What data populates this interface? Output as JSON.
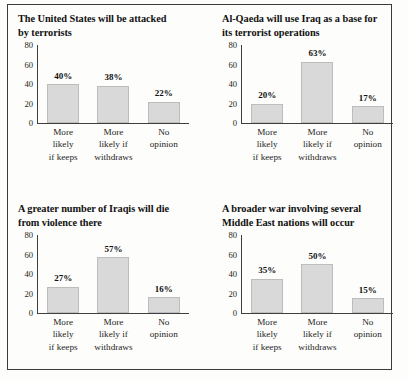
{
  "page": {
    "background_color": "#fdfdfb",
    "rule_color": "#3b3b3b",
    "bar_fill_color": "#d9d9d9",
    "bar_border_color": "#bdbdbd"
  },
  "charts": [
    {
      "id": "chart-terrorist-attack",
      "title_line1": "The United States will be attacked",
      "title_line2": "by terrorists",
      "y_ticks": [
        "80",
        "60",
        "40",
        "20",
        "0"
      ],
      "categories": [
        {
          "line1": "More",
          "line2": "likely",
          "line3": "if keeps"
        },
        {
          "line1": "More",
          "line2": "likely if",
          "line3": "withdraws"
        },
        {
          "line1": "No",
          "line2": "opinion",
          "line3": ""
        }
      ],
      "values": [
        40,
        38,
        22
      ],
      "value_labels": [
        "40%",
        "38%",
        "22%"
      ]
    },
    {
      "id": "chart-alqaeda-base",
      "title_line1": "Al-Qaeda will use Iraq as a base for",
      "title_line2": "its terrorist operations",
      "y_ticks": [
        "80",
        "60",
        "40",
        "20",
        "0"
      ],
      "categories": [
        {
          "line1": "More",
          "line2": "likely",
          "line3": "if keeps"
        },
        {
          "line1": "More",
          "line2": "likely if",
          "line3": "withdraws"
        },
        {
          "line1": "No",
          "line2": "opinion",
          "line3": ""
        }
      ],
      "values": [
        20,
        63,
        17
      ],
      "value_labels": [
        "20%",
        "63%",
        "17%"
      ]
    },
    {
      "id": "chart-iraqi-deaths",
      "title_line1": "A greater number of Iraqis will die",
      "title_line2": "from violence there",
      "y_ticks": [
        "80",
        "60",
        "40",
        "20",
        "0"
      ],
      "categories": [
        {
          "line1": "More",
          "line2": "likely",
          "line3": "if keeps"
        },
        {
          "line1": "More",
          "line2": "likely if",
          "line3": "withdraws"
        },
        {
          "line1": "No",
          "line2": "opinion",
          "line3": ""
        }
      ],
      "values": [
        27,
        57,
        16
      ],
      "value_labels": [
        "27%",
        "57%",
        "16%"
      ]
    },
    {
      "id": "chart-broader-war",
      "title_line1": "A broader war involving several",
      "title_line2": "Middle East nations will occur",
      "y_ticks": [
        "80",
        "60",
        "40",
        "20",
        "0"
      ],
      "categories": [
        {
          "line1": "More",
          "line2": "likely",
          "line3": "if keeps"
        },
        {
          "line1": "More",
          "line2": "likely if",
          "line3": "withdraws"
        },
        {
          "line1": "No",
          "line2": "opinion",
          "line3": ""
        }
      ],
      "values": [
        35,
        50,
        15
      ],
      "value_labels": [
        "35%",
        "50%",
        "15%"
      ]
    }
  ],
  "chart_data": [
    {
      "type": "bar",
      "title": "The United States will be attacked by terrorists",
      "categories": [
        "More likely if keeps",
        "More likely if withdraws",
        "No opinion"
      ],
      "values": [
        40,
        38,
        22
      ],
      "data_labels": [
        "40%",
        "38%",
        "22%"
      ],
      "xlabel": "",
      "ylabel": "",
      "ylim": [
        0,
        80
      ],
      "yticks": [
        0,
        20,
        40,
        60,
        80
      ],
      "grid": false,
      "legend": "none"
    },
    {
      "type": "bar",
      "title": "Al-Qaeda will use Iraq as a base for its terrorist operations",
      "categories": [
        "More likely if keeps",
        "More likely if withdraws",
        "No opinion"
      ],
      "values": [
        20,
        63,
        17
      ],
      "data_labels": [
        "20%",
        "63%",
        "17%"
      ],
      "xlabel": "",
      "ylabel": "",
      "ylim": [
        0,
        80
      ],
      "yticks": [
        0,
        20,
        40,
        60,
        80
      ],
      "grid": false,
      "legend": "none"
    },
    {
      "type": "bar",
      "title": "A greater number of Iraqis will die from violence there",
      "categories": [
        "More likely if keeps",
        "More likely if withdraws",
        "No opinion"
      ],
      "values": [
        27,
        57,
        16
      ],
      "data_labels": [
        "27%",
        "57%",
        "16%"
      ],
      "xlabel": "",
      "ylabel": "",
      "ylim": [
        0,
        80
      ],
      "yticks": [
        0,
        20,
        40,
        60,
        80
      ],
      "grid": false,
      "legend": "none"
    },
    {
      "type": "bar",
      "title": "A broader war involving several Middle East nations will occur",
      "categories": [
        "More likely if keeps",
        "More likely if withdraws",
        "No opinion"
      ],
      "values": [
        35,
        50,
        15
      ],
      "data_labels": [
        "35%",
        "50%",
        "15%"
      ],
      "xlabel": "",
      "ylabel": "",
      "ylim": [
        0,
        80
      ],
      "yticks": [
        0,
        20,
        40,
        60,
        80
      ],
      "grid": false,
      "legend": "none"
    }
  ]
}
